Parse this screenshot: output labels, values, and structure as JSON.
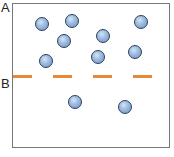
{
  "labels": {
    "a": "A",
    "b": "B"
  },
  "colors": {
    "dash": "#e8883a",
    "particle": "#8fb0da",
    "border": "#777777"
  },
  "particles": [
    {
      "x": 42,
      "y": 24
    },
    {
      "x": 72,
      "y": 21
    },
    {
      "x": 141,
      "y": 22
    },
    {
      "x": 64,
      "y": 41
    },
    {
      "x": 103,
      "y": 36
    },
    {
      "x": 46,
      "y": 61
    },
    {
      "x": 98,
      "y": 57
    },
    {
      "x": 135,
      "y": 52
    },
    {
      "x": 75,
      "y": 102
    },
    {
      "x": 125,
      "y": 107
    }
  ],
  "dashes": [
    {
      "x1": 13,
      "x2": 32
    },
    {
      "x1": 53,
      "x2": 72
    },
    {
      "x1": 93,
      "x2": 112
    },
    {
      "x1": 133,
      "x2": 152
    }
  ],
  "dash_y": 76
}
